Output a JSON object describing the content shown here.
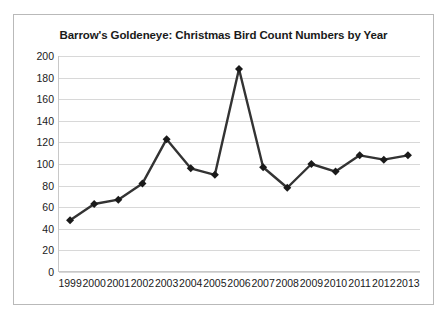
{
  "chart_data": {
    "type": "line",
    "title": "Barrow's Goldeneye: Christmas Bird Count Numbers by Year",
    "xlabel": "",
    "ylabel": "",
    "categories": [
      "1999",
      "2000",
      "2001",
      "2002",
      "2003",
      "2004",
      "2005",
      "2006",
      "2007",
      "2008",
      "2009",
      "2010",
      "2011",
      "2012",
      "2013"
    ],
    "values": [
      48,
      63,
      67,
      82,
      123,
      96,
      90,
      188,
      97,
      78,
      100,
      93,
      108,
      104,
      108
    ],
    "series": [
      {
        "name": "Barrow's Goldeneye count",
        "values": [
          48,
          63,
          67,
          82,
          123,
          96,
          90,
          188,
          97,
          78,
          100,
          93,
          108,
          104,
          108
        ]
      }
    ],
    "ylim": [
      0,
      200
    ],
    "yticks": [
      0,
      20,
      40,
      60,
      80,
      100,
      120,
      140,
      160,
      180,
      200
    ],
    "ytick_labels": [
      "0",
      "20",
      "40",
      "60",
      "80",
      "100",
      "120",
      "140",
      "160",
      "180",
      "200"
    ],
    "xtick_labels": [
      "1999",
      "2000",
      "2001",
      "2002",
      "2003",
      "2004",
      "2005",
      "2006",
      "2007",
      "2008",
      "2009",
      "2010",
      "2011",
      "2012",
      "2013"
    ],
    "grid": "horizontal",
    "legend": "none",
    "marker": "diamond",
    "line_color": "#333333",
    "marker_color": "#1a1a1a",
    "grid_color": "#d8d8d8",
    "plot_background": "#ffffff",
    "border_color": "#b9b9b9"
  }
}
